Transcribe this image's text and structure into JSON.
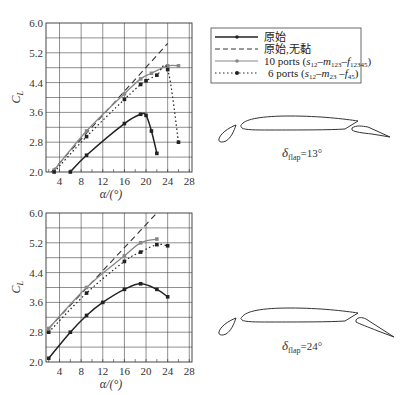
{
  "legend": {
    "items": [
      {
        "label": "原始",
        "style": "solid",
        "color": "#222222",
        "marker": true
      },
      {
        "label": "原始,无黏",
        "style": "dashed",
        "color": "#333333",
        "marker": false
      },
      {
        "label": "10 ports (s12–m123–f12345)",
        "label_main": "10 ports (",
        "style": "solid",
        "color": "#888888",
        "marker": true
      },
      {
        "label": "6 ports (s12–m23 –f45)",
        "label_main": "6 ports (",
        "style": "dotted",
        "color": "#222222",
        "marker": true
      }
    ]
  },
  "captions": {
    "top": {
      "symbol": "δ",
      "sub": "flap",
      "value": "=13°"
    },
    "bottom": {
      "symbol": "δ",
      "sub": "flap",
      "value": "=24°"
    }
  },
  "chart_data": [
    {
      "type": "line",
      "title": "",
      "xlabel": "α/(°)",
      "ylabel": "C_L",
      "xlim": [
        1.5,
        28.5
      ],
      "ylim": [
        2.0,
        6.0
      ],
      "xticks": [
        "4",
        "8",
        "12",
        "16",
        "20",
        "24",
        "28"
      ],
      "yticks": [
        "2.0",
        "2.8",
        "3.6",
        "4.4",
        "5.2",
        "6.0"
      ],
      "grid": true,
      "annotation": "δflap=13°",
      "series": [
        {
          "name": "原始",
          "style": "solid",
          "color": "#222222",
          "x": [
            6,
            9,
            16,
            19,
            20,
            21,
            22
          ],
          "y": [
            2.0,
            2.45,
            3.3,
            3.55,
            3.52,
            3.1,
            2.5
          ]
        },
        {
          "name": "原始,无黏",
          "style": "dashed",
          "color": "#333333",
          "x": [
            2.5,
            24
          ],
          "y": [
            2.0,
            5.45
          ]
        },
        {
          "name": "10 ports (s12-m123-f12345)",
          "style": "solid",
          "color": "#888888",
          "x": [
            3,
            9,
            16,
            19,
            21,
            24,
            26
          ],
          "y": [
            2.05,
            3.1,
            4.1,
            4.5,
            4.65,
            4.85,
            4.85
          ]
        },
        {
          "name": "6 ports (s12-m23-f45)",
          "style": "dotted",
          "color": "#222222",
          "x": [
            3,
            9,
            16,
            19,
            20,
            22,
            24,
            26
          ],
          "y": [
            2.0,
            2.95,
            3.95,
            4.35,
            4.45,
            4.6,
            4.75,
            2.8
          ]
        }
      ]
    },
    {
      "type": "line",
      "title": "",
      "xlabel": "α/(°)",
      "ylabel": "C_L",
      "xlim": [
        1.5,
        28.5
      ],
      "ylim": [
        2.0,
        6.0
      ],
      "xticks": [
        "4",
        "8",
        "12",
        "16",
        "20",
        "24",
        "28"
      ],
      "yticks": [
        "2.0",
        "2.8",
        "3.6",
        "4.4",
        "5.2",
        "6.0"
      ],
      "grid": true,
      "annotation": "δflap=24°",
      "series": [
        {
          "name": "原始",
          "style": "solid",
          "color": "#222222",
          "x": [
            2,
            6,
            9,
            12,
            16,
            19,
            22,
            24
          ],
          "y": [
            2.1,
            2.8,
            3.25,
            3.6,
            3.95,
            4.1,
            3.95,
            3.75
          ]
        },
        {
          "name": "原始,无黏",
          "style": "dashed",
          "color": "#333333",
          "x": [
            2,
            22
          ],
          "y": [
            2.9,
            6.0
          ]
        },
        {
          "name": "10 ports (s12-m123-f12345)",
          "style": "solid",
          "color": "#888888",
          "x": [
            2,
            9,
            16,
            19,
            22
          ],
          "y": [
            2.9,
            4.0,
            4.85,
            5.2,
            5.3
          ]
        },
        {
          "name": "6 ports (s12-m23-f45)",
          "style": "dotted",
          "color": "#222222",
          "x": [
            2,
            9,
            16,
            19,
            22,
            24
          ],
          "y": [
            2.8,
            3.85,
            4.7,
            4.95,
            5.15,
            5.12
          ]
        }
      ]
    }
  ]
}
